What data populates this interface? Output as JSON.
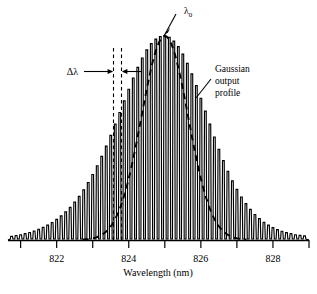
{
  "figure": {
    "kind": "laser-longitudinal-mode-spectrum",
    "background_color": "#ffffff",
    "line_color": "#000000"
  },
  "axis": {
    "x_title": "Wavelength (nm)",
    "tick_labels": [
      "822",
      "824",
      "826",
      "828"
    ],
    "labeled_tick_values": [
      822,
      824,
      826,
      828
    ],
    "minor_tick_values": [
      821,
      823,
      825,
      827,
      829
    ],
    "x_min": 820.65,
    "x_max": 829.0,
    "baseline_y_px": 240,
    "axis_left_px": 8,
    "axis_right_px": 309
  },
  "annotations": {
    "peak_label": "λ",
    "peak_label_subscript": "0",
    "peak_label_full": "λ0",
    "delta_label": "Δλ",
    "envelope_label_line1": "Gaussian",
    "envelope_label_line2": "output",
    "envelope_label_line3": "profile"
  },
  "chart_data": {
    "type": "line",
    "title": "",
    "xlabel": "Wavelength (nm)",
    "ylabel": "",
    "xlim": [
      820.65,
      829.0
    ],
    "ylim": [
      0,
      1.0
    ],
    "grid": false,
    "legend": false,
    "envelope": {
      "name": "Gaussian output profile",
      "style": "dashed",
      "center_nm": 825.0,
      "fwhm_nm": 1.52,
      "peak_amplitude": 1.0,
      "x": [
        823.0,
        823.25,
        823.5,
        823.75,
        824.0,
        824.25,
        824.5,
        824.75,
        825.0,
        825.25,
        825.5,
        825.75,
        826.0,
        826.25,
        826.5,
        826.75,
        827.0
      ],
      "y": [
        0.067,
        0.117,
        0.19,
        0.295,
        0.43,
        0.59,
        0.76,
        0.925,
        1.0,
        0.925,
        0.76,
        0.59,
        0.43,
        0.295,
        0.19,
        0.117,
        0.067
      ]
    },
    "modes": {
      "name": "Longitudinal modes",
      "mode_spacing_nm": 0.125,
      "x": [
        820.75,
        820.875,
        821.0,
        821.125,
        821.25,
        821.375,
        821.5,
        821.625,
        821.75,
        821.875,
        822.0,
        822.125,
        822.25,
        822.375,
        822.5,
        822.625,
        822.75,
        822.875,
        823.0,
        823.125,
        823.25,
        823.375,
        823.5,
        823.625,
        823.75,
        823.875,
        824.0,
        824.125,
        824.25,
        824.375,
        824.5,
        824.625,
        824.75,
        824.875,
        825.0,
        825.125,
        825.25,
        825.375,
        825.5,
        825.625,
        825.75,
        825.875,
        826.0,
        826.125,
        826.25,
        826.375,
        826.5,
        826.625,
        826.75,
        826.875,
        827.0,
        827.125,
        827.25,
        827.375,
        827.5,
        827.625,
        827.75,
        827.875,
        828.0,
        828.125,
        828.25,
        828.375,
        828.5,
        828.625,
        828.75,
        828.875
      ],
      "y": [
        0.018,
        0.022,
        0.026,
        0.031,
        0.037,
        0.044,
        0.052,
        0.062,
        0.073,
        0.086,
        0.101,
        0.118,
        0.138,
        0.16,
        0.186,
        0.214,
        0.246,
        0.282,
        0.321,
        0.364,
        0.41,
        0.46,
        0.513,
        0.568,
        0.625,
        0.682,
        0.739,
        0.794,
        0.846,
        0.892,
        0.932,
        0.963,
        0.985,
        0.997,
        1.0,
        0.993,
        0.975,
        0.948,
        0.911,
        0.866,
        0.814,
        0.757,
        0.695,
        0.632,
        0.568,
        0.505,
        0.445,
        0.389,
        0.337,
        0.29,
        0.248,
        0.211,
        0.178,
        0.15,
        0.125,
        0.105,
        0.087,
        0.073,
        0.061,
        0.051,
        0.043,
        0.036,
        0.031,
        0.026,
        0.023,
        0.02
      ]
    }
  }
}
